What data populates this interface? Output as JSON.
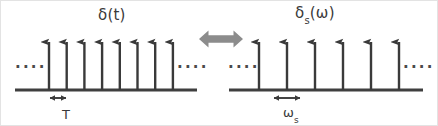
{
  "figure": {
    "colors": {
      "stroke": "#3a3a3a",
      "baseline": "#3f3f3f",
      "center_arrow": "#8c8c8c",
      "background": "#ffffff",
      "border": "#e3e3e3"
    },
    "left_panel": {
      "label_main": "δ(t)",
      "label_symbol": "δ",
      "label_arg": "(t)",
      "spike_count": 8,
      "spike_first_x": 48,
      "spike_spacing": 17.7,
      "baseline_y": 89,
      "spike_top_y": 34,
      "baseline_x_start": 14,
      "baseline_x_end": 196,
      "ellipsis_left": "....",
      "ellipsis_right": "....",
      "measure_label": "T",
      "measure_sub": "",
      "measure_x_start": 48,
      "measure_x_end": 66,
      "measure_y": 97
    },
    "right_panel": {
      "label_symbol": "δ",
      "label_sub": "s",
      "label_arg": "(ω)",
      "label_main": "δₛ(ω)",
      "spike_count": 6,
      "spike_first_x": 258,
      "spike_spacing": 28,
      "baseline_y": 89,
      "spike_top_y": 34,
      "baseline_x_start": 228,
      "baseline_x_end": 422,
      "ellipsis_left": "....",
      "ellipsis_right": "....",
      "measure_label": "ω",
      "measure_sub": "s",
      "measure_x_start": 272,
      "measure_x_end": 300,
      "measure_y": 97
    },
    "center_arrow": {
      "name": "bidirectional-transform-arrow",
      "x_start": 198,
      "x_end": 242,
      "y": 38,
      "color": "#8c8c8c"
    }
  }
}
